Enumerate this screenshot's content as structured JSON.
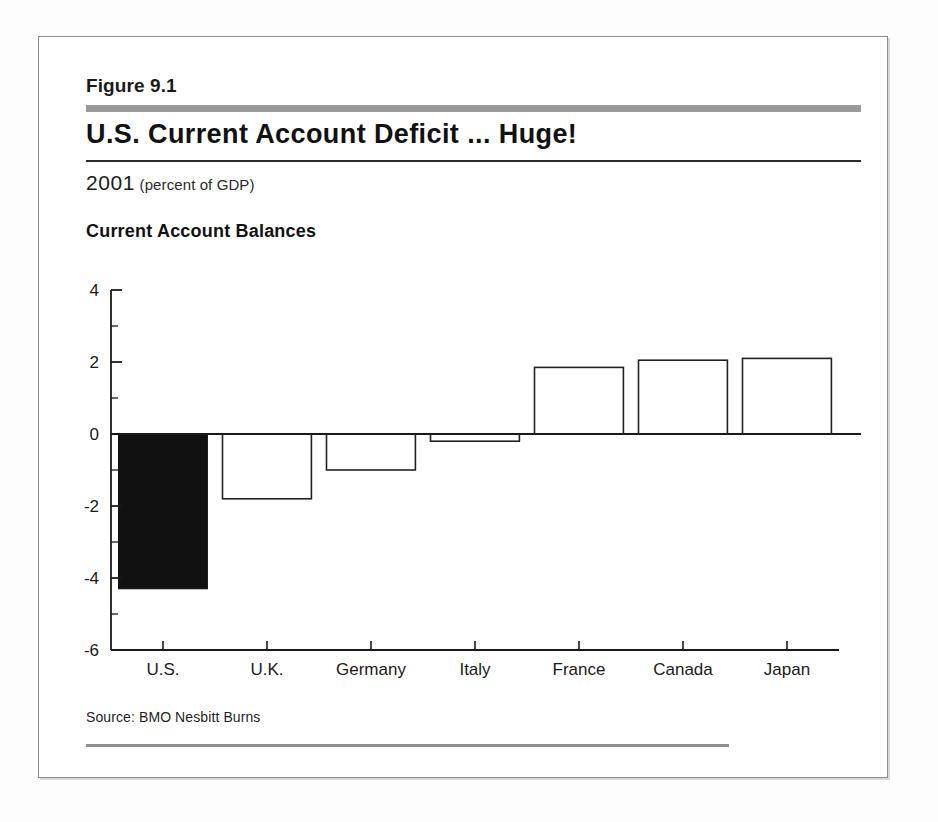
{
  "figure": {
    "number": "Figure 9.1",
    "title": "U.S. Current Account Deficit ... Huge!",
    "year": "2001",
    "units": "(percent of GDP)",
    "source": "Source: BMO Nesbitt Burns"
  },
  "colors": {
    "highlight_bar": "#111111",
    "bar_outline": "#222222",
    "bar_fill": "#ffffff",
    "axis": "#1a1a1a",
    "rule_gray": "#9a9a9a",
    "frame": "#8d8d8d"
  },
  "chart_data": {
    "type": "bar",
    "title": "Current Account Balances",
    "subtitle": "2001 (percent of GDP)",
    "xlabel": "",
    "ylabel": "",
    "ylim": [
      -6,
      4
    ],
    "yticks": [
      4,
      2,
      0,
      -2,
      -4,
      -6
    ],
    "ytick_labels": [
      "4",
      "2",
      "0",
      "-2",
      "-4",
      "-6"
    ],
    "minor_tick_step": 1,
    "grid": false,
    "legend": false,
    "zero_line": 0,
    "categories": [
      "U.S.",
      "U.K.",
      "Germany",
      "Italy",
      "France",
      "Canada",
      "Japan"
    ],
    "values": [
      -4.3,
      -1.8,
      -1.0,
      -0.2,
      1.85,
      2.05,
      2.1
    ],
    "highlighted": [
      "U.S."
    ],
    "bar_styles": [
      "filled",
      "outline",
      "outline",
      "outline",
      "outline",
      "outline",
      "outline"
    ]
  }
}
